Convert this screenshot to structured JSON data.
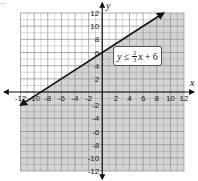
{
  "chart_data": {
    "type": "line",
    "title": "",
    "inequality_label": {
      "lhs": "y",
      "operator": "≤",
      "numerator": "2",
      "denominator": "3",
      "rhs_var": "x",
      "rhs_rest": "+ 6",
      "full_text": "y ≤ 2/3 x + 6"
    },
    "xlabel": "x",
    "ylabel": "y",
    "xlim": [
      -12,
      12
    ],
    "ylim": [
      -12,
      12
    ],
    "grid": true,
    "grid_step": 2,
    "x_ticks": [
      "-12",
      "-10",
      "-8",
      "-6",
      "-4",
      "-2",
      "2",
      "4",
      "6",
      "8",
      "10",
      "12"
    ],
    "y_ticks": [
      "12",
      "10",
      "8",
      "6",
      "4",
      "2",
      "-2",
      "-4",
      "-6",
      "-8",
      "-10",
      "-12"
    ],
    "line": {
      "slope": 0.6667,
      "intercept": 6,
      "style": "solid",
      "arrows": "both",
      "points": [
        {
          "x": -12,
          "y": -2
        },
        {
          "x": 9,
          "y": 12
        }
      ]
    },
    "shading": {
      "region": "below line",
      "color": "#d4d4d4"
    },
    "colors": {
      "grid": "#8a8a8a",
      "axis": "#111111",
      "line": "#111111",
      "shade": "#d4d4d4",
      "background": "#ffffff"
    }
  },
  "corner_mark": "··"
}
